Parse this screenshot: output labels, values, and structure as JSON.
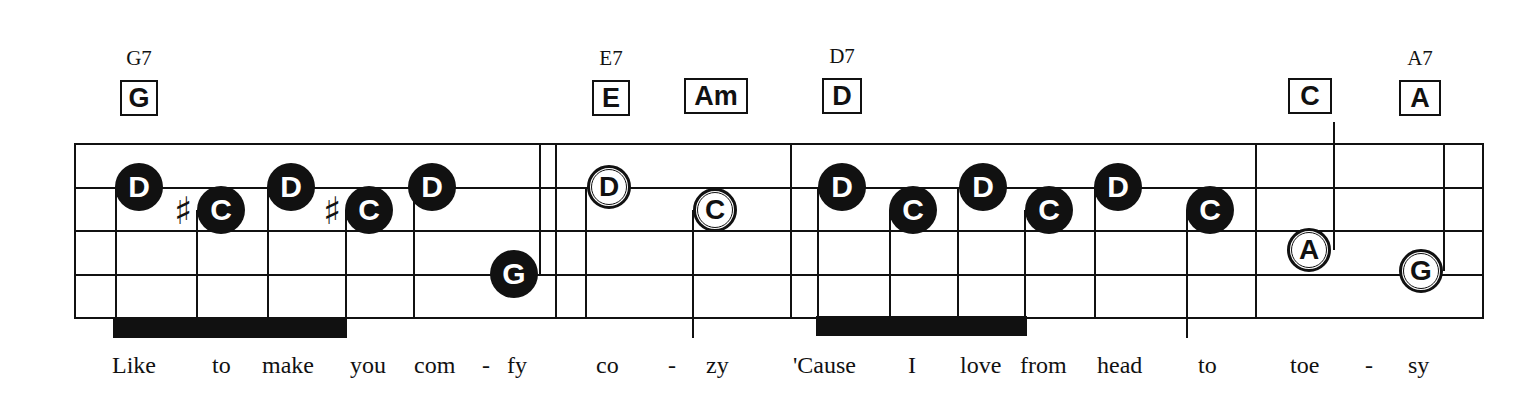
{
  "chords": [
    {
      "name": "G7",
      "box": "G",
      "x": 139
    },
    {
      "name": "E7",
      "box": "E",
      "x": 611
    },
    {
      "name": "",
      "box": "Am",
      "x": 716
    },
    {
      "name": "D7",
      "box": "D",
      "x": 842
    },
    {
      "name": "",
      "box": "C",
      "x": 1310
    },
    {
      "name": "A7",
      "box": "A",
      "x": 1420
    }
  ],
  "staff": {
    "left": 74,
    "right": 1483,
    "lines_y": [
      144,
      188,
      231,
      275,
      318
    ]
  },
  "notes": [
    {
      "letter": "D",
      "style": "filled",
      "accidental": "",
      "x": 139,
      "y": 187
    },
    {
      "letter": "C",
      "style": "filled",
      "accidental": "♯",
      "x": 221,
      "y": 210
    },
    {
      "letter": "D",
      "style": "filled",
      "accidental": "",
      "x": 291,
      "y": 187
    },
    {
      "letter": "C",
      "style": "filled",
      "accidental": "♯",
      "x": 369,
      "y": 210
    },
    {
      "letter": "D",
      "style": "filled",
      "accidental": "",
      "x": 432,
      "y": 187
    },
    {
      "letter": "G",
      "style": "filled",
      "accidental": "",
      "x": 514,
      "y": 274
    },
    {
      "letter": "D",
      "style": "open",
      "accidental": "",
      "x": 611,
      "y": 187
    },
    {
      "letter": "C",
      "style": "open",
      "accidental": "",
      "x": 714,
      "y": 210
    },
    {
      "letter": "D",
      "style": "filled",
      "accidental": "",
      "x": 846,
      "y": 187
    },
    {
      "letter": "C",
      "style": "filled",
      "accidental": "",
      "x": 914,
      "y": 210
    },
    {
      "letter": "D",
      "style": "filled",
      "accidental": "",
      "x": 984,
      "y": 187
    },
    {
      "letter": "C",
      "style": "filled",
      "accidental": "",
      "x": 1049,
      "y": 210
    },
    {
      "letter": "D",
      "style": "filled",
      "accidental": "",
      "x": 1118,
      "y": 187
    },
    {
      "letter": "C",
      "style": "filled",
      "accidental": "",
      "x": 1210,
      "y": 210
    },
    {
      "letter": "A",
      "style": "open",
      "accidental": "",
      "x": 1309,
      "y": 250
    },
    {
      "letter": "G",
      "style": "open",
      "accidental": "",
      "x": 1421,
      "y": 271
    }
  ],
  "lyrics": [
    {
      "text": "Like",
      "x": 112
    },
    {
      "text": "to",
      "x": 212
    },
    {
      "text": "make",
      "x": 262
    },
    {
      "text": "you",
      "x": 350
    },
    {
      "text": "com",
      "x": 414
    },
    {
      "text": "-",
      "x": 480
    },
    {
      "text": "fy",
      "x": 507
    },
    {
      "text": "co",
      "x": 596
    },
    {
      "text": "-",
      "x": 668
    },
    {
      "text": "zy",
      "x": 706
    },
    {
      "text": "'Cause",
      "x": 793
    },
    {
      "text": "I",
      "x": 908
    },
    {
      "text": "love",
      "x": 960
    },
    {
      "text": "from",
      "x": 1020
    },
    {
      "text": "head",
      "x": 1097
    },
    {
      "text": "to",
      "x": 1198
    },
    {
      "text": "toe",
      "x": 1290
    },
    {
      "text": "-",
      "x": 1365
    },
    {
      "text": "sy",
      "x": 1408
    }
  ]
}
